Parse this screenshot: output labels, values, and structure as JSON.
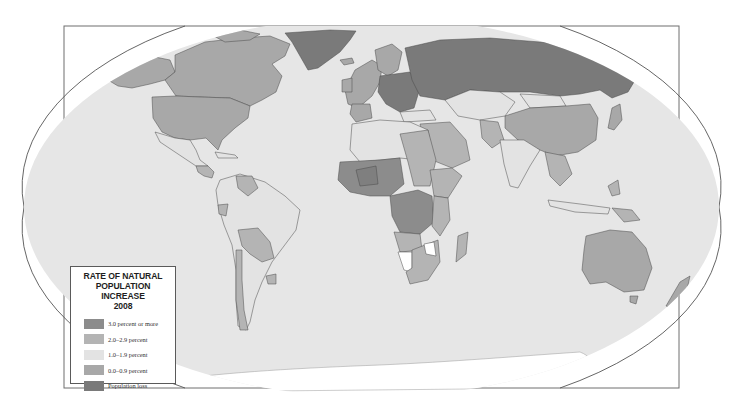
{
  "map": {
    "title": "RATE OF NATURAL POPULATION INCREASE 2008",
    "projection": "elliptical world projection in rectangular frame",
    "colors": {
      "ocean": "#e6e6e6",
      "frame_bg": "#ffffff",
      "frame_line": "#6e6e6e",
      "border_line": "#4a4a4a"
    }
  },
  "legend": {
    "title_line1": "RATE OF NATURAL",
    "title_line2": "POPULATION INCREASE",
    "title_line3": "2008",
    "items": [
      {
        "label": "3.0 percent or more",
        "color": "#8c8c8c",
        "key": "c3"
      },
      {
        "label": "2.0–2.9 percent",
        "color": "#b4b4b4",
        "key": "c2"
      },
      {
        "label": "1.0–1.9 percent",
        "color": "#e3e3e3",
        "key": "c1"
      },
      {
        "label": "0.0–0.9 percent",
        "color": "#a8a8a8",
        "key": "c0"
      },
      {
        "label": "Population loss",
        "color": "#7a7a7a",
        "key": "loss"
      }
    ]
  },
  "regions": [
    {
      "name": "Greenland",
      "category": "Population loss"
    },
    {
      "name": "Russia",
      "category": "Population loss"
    },
    {
      "name": "Eastern Europe",
      "category": "Population loss"
    },
    {
      "name": "Canada",
      "category": "0.0–0.9 percent"
    },
    {
      "name": "United States",
      "category": "0.0–0.9 percent"
    },
    {
      "name": "China",
      "category": "0.0–0.9 percent"
    },
    {
      "name": "Australia",
      "category": "0.0–0.9 percent"
    },
    {
      "name": "Western Europe",
      "category": "0.0–0.9 percent"
    },
    {
      "name": "Mexico",
      "category": "1.0–1.9 percent"
    },
    {
      "name": "Brazil",
      "category": "1.0–1.9 percent"
    },
    {
      "name": "India",
      "category": "1.0–1.9 percent"
    },
    {
      "name": "Central Asia",
      "category": "1.0–1.9 percent"
    },
    {
      "name": "Chile / Bolivia / Paraguay",
      "category": "2.0–2.9 percent"
    },
    {
      "name": "Central Africa",
      "category": "3.0 percent or more"
    },
    {
      "name": "West Africa",
      "category": "3.0 percent or more"
    },
    {
      "name": "Southern Africa",
      "category": "2.0–2.9 percent"
    },
    {
      "name": "Middle East",
      "category": "2.0–2.9 percent"
    }
  ]
}
